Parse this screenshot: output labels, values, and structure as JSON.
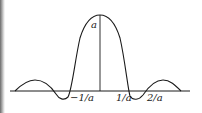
{
  "figure": {
    "peak_label": "a",
    "tick_labels": [
      {
        "text": "−1/a",
        "x": 70,
        "y": 101
      },
      {
        "text": "1/a",
        "x": 116,
        "y": 101
      },
      {
        "text": "2/a",
        "x": 147,
        "y": 101
      }
    ],
    "colors": {
      "ink": "#1a1a1a",
      "background": "#ffffff"
    }
  }
}
